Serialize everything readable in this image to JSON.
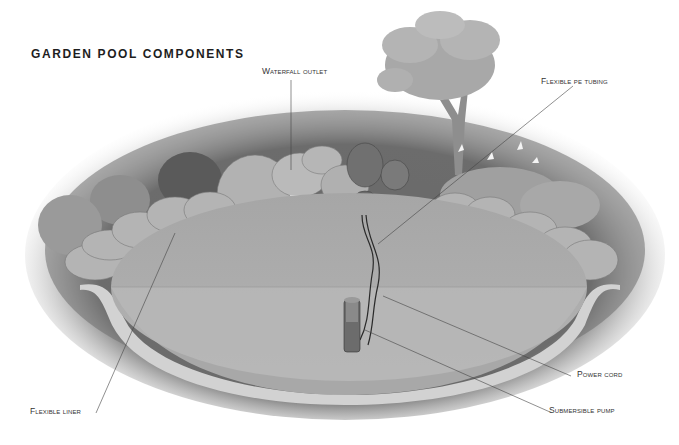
{
  "diagram": {
    "title": "GARDEN POOL COMPONENTS",
    "labels": {
      "waterfall_outlet": "Waterfall outlet",
      "flexible_pe_tubing": "Flexible pe tubing",
      "power_cord": "Power cord",
      "submersible_pump": "Submersible pump",
      "flexible_liner": "Flexible liner"
    }
  },
  "colors": {
    "background": "#ffffff",
    "ground_dark": "#5a5a5a",
    "ground_mid": "#7a7a7a",
    "water": "#a8a8a8",
    "water_lower": "#b8b8b8",
    "liner_edge": "#d8d8d8",
    "rock": "#b0b0b0",
    "rock_shadow": "#8a8a8a",
    "text": "#333333",
    "leader_line": "#444444"
  }
}
